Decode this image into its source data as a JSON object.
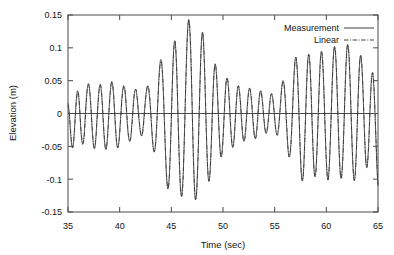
{
  "chart_data": {
    "type": "line",
    "title": "",
    "xlabel": "Time (sec)",
    "ylabel": "Elevation (m)",
    "xlim": [
      35,
      65
    ],
    "ylim": [
      -0.15,
      0.15
    ],
    "xticks": [
      35,
      40,
      45,
      50,
      55,
      60,
      65
    ],
    "xtick_labels": [
      "35",
      "40",
      "45",
      "50",
      "55",
      "60",
      "65"
    ],
    "yticks": [
      -0.15,
      -0.1,
      -0.05,
      0,
      0.05,
      0.1,
      0.15
    ],
    "ytick_labels": [
      "-0.15",
      "-0.1",
      "-0.05",
      "0",
      "0.05",
      "0.1",
      "0.15"
    ],
    "grid": false,
    "zero_line": 0,
    "legend_position": "top-right",
    "legend": [
      {
        "name": "Measurement",
        "style": "solid"
      },
      {
        "name": "Linear",
        "style": "dash-dot"
      }
    ],
    "x": [
      35.0,
      35.1,
      35.2,
      35.3,
      35.4,
      35.5,
      35.6,
      35.7,
      35.8,
      35.9,
      36.0,
      36.1,
      36.2,
      36.3,
      36.4,
      36.5,
      36.6,
      36.7,
      36.8,
      36.9,
      37.0,
      37.1,
      37.2,
      37.3,
      37.4,
      37.5,
      37.6,
      37.7,
      37.8,
      37.9,
      38.0,
      38.1,
      38.2,
      38.3,
      38.4,
      38.5,
      38.6,
      38.7,
      38.8,
      38.9,
      39.0,
      39.1,
      39.2,
      39.3,
      39.4,
      39.5,
      39.6,
      39.7,
      39.8,
      39.9,
      40.0,
      40.1,
      40.2,
      40.3,
      40.4,
      40.5,
      40.6,
      40.7,
      40.8,
      40.9,
      41.0,
      41.1,
      41.2,
      41.3,
      41.4,
      41.5,
      41.6,
      41.7,
      41.8,
      41.9,
      42.0,
      42.1,
      42.2,
      42.3,
      42.4,
      42.5,
      42.6,
      42.7,
      42.8,
      42.9,
      43.0,
      43.1,
      43.2,
      43.3,
      43.4,
      43.5,
      43.6,
      43.7,
      43.8,
      43.9,
      44.0,
      44.1,
      44.2,
      44.3,
      44.4,
      44.5,
      44.6,
      44.7,
      44.8,
      44.9,
      45.0,
      45.1,
      45.2,
      45.3,
      45.4,
      45.5,
      45.6,
      45.7,
      45.8,
      45.9,
      46.0,
      46.1,
      46.2,
      46.3,
      46.4,
      46.5,
      46.6,
      46.7,
      46.8,
      46.9,
      47.0,
      47.1,
      47.2,
      47.3,
      47.4,
      47.5,
      47.6,
      47.7,
      47.8,
      47.9,
      48.0,
      48.1,
      48.2,
      48.3,
      48.4,
      48.5,
      48.6,
      48.7,
      48.8,
      48.9,
      49.0,
      49.1,
      49.2,
      49.3,
      49.4,
      49.5,
      49.6,
      49.7,
      49.8,
      49.9,
      50.0,
      50.1,
      50.2,
      50.3,
      50.4,
      50.5,
      50.6,
      50.7,
      50.8,
      50.9,
      51.0,
      51.1,
      51.2,
      51.3,
      51.4,
      51.5,
      51.6,
      51.7,
      51.8,
      51.9,
      52.0,
      52.1,
      52.2,
      52.3,
      52.4,
      52.5,
      52.6,
      52.7,
      52.8,
      52.9,
      53.0,
      53.1,
      53.2,
      53.3,
      53.4,
      53.5,
      53.6,
      53.7,
      53.8,
      53.9,
      54.0,
      54.1,
      54.2,
      54.3,
      54.4,
      54.5,
      54.6,
      54.7,
      54.8,
      54.9,
      55.0,
      55.1,
      55.2,
      55.3,
      55.4,
      55.5,
      55.6,
      55.7,
      55.8,
      55.9,
      56.0,
      56.1,
      56.2,
      56.3,
      56.4,
      56.5,
      56.6,
      56.7,
      56.8,
      56.9,
      57.0,
      57.1,
      57.2,
      57.3,
      57.4,
      57.5,
      57.6,
      57.7,
      57.8,
      57.9,
      58.0,
      58.1,
      58.2,
      58.3,
      58.4,
      58.5,
      58.6,
      58.7,
      58.8,
      58.9,
      59.0,
      59.1,
      59.2,
      59.3,
      59.4,
      59.5,
      59.6,
      59.7,
      59.8,
      59.9,
      60.0,
      60.1,
      60.2,
      60.3,
      60.4,
      60.5,
      60.6,
      60.7,
      60.8,
      60.9,
      61.0,
      61.1,
      61.2,
      61.3,
      61.4,
      61.5,
      61.6,
      61.7,
      61.8,
      61.9,
      62.0,
      62.1,
      62.2,
      62.3,
      62.4,
      62.5,
      62.6,
      62.7,
      62.8,
      62.9,
      63.0,
      63.1,
      63.2,
      63.3,
      63.4,
      63.5,
      63.6,
      63.7,
      63.8,
      63.9,
      64.0,
      64.1,
      64.2,
      64.3,
      64.4,
      64.5,
      64.6,
      64.7,
      64.8,
      64.9,
      65.0
    ],
    "series": [
      {
        "name": "Measurement",
        "style": "solid",
        "values": [
          0.012,
          0.004,
          -0.018,
          -0.04,
          -0.052,
          -0.048,
          -0.03,
          -0.004,
          0.02,
          0.034,
          0.03,
          0.012,
          -0.014,
          -0.036,
          -0.046,
          -0.042,
          -0.024,
          0.004,
          0.028,
          0.042,
          0.045,
          0.034,
          0.012,
          -0.014,
          -0.038,
          -0.052,
          -0.052,
          -0.036,
          -0.01,
          0.016,
          0.036,
          0.044,
          0.038,
          0.018,
          -0.01,
          -0.036,
          -0.052,
          -0.054,
          -0.04,
          -0.014,
          0.014,
          0.036,
          0.048,
          0.046,
          0.03,
          0.004,
          -0.024,
          -0.044,
          -0.052,
          -0.046,
          -0.028,
          -0.004,
          0.02,
          0.036,
          0.042,
          0.036,
          0.018,
          -0.006,
          -0.028,
          -0.04,
          -0.042,
          -0.032,
          -0.012,
          0.01,
          0.028,
          0.036,
          0.034,
          0.022,
          0.004,
          -0.014,
          -0.028,
          -0.034,
          -0.03,
          -0.016,
          0.004,
          0.022,
          0.036,
          0.042,
          0.038,
          0.024,
          0.002,
          -0.024,
          -0.046,
          -0.058,
          -0.056,
          -0.04,
          -0.012,
          0.022,
          0.054,
          0.076,
          0.082,
          0.07,
          0.042,
          0.0,
          -0.046,
          -0.086,
          -0.11,
          -0.114,
          -0.096,
          -0.058,
          -0.006,
          0.048,
          0.09,
          0.11,
          0.104,
          0.072,
          0.022,
          -0.036,
          -0.086,
          -0.118,
          -0.126,
          -0.108,
          -0.068,
          -0.012,
          0.048,
          0.1,
          0.134,
          0.143,
          0.124,
          0.08,
          0.018,
          -0.048,
          -0.1,
          -0.128,
          -0.128,
          -0.102,
          -0.056,
          0.004,
          0.062,
          0.106,
          0.124,
          0.112,
          0.074,
          0.02,
          -0.036,
          -0.08,
          -0.102,
          -0.098,
          -0.072,
          -0.03,
          0.016,
          0.054,
          0.074,
          0.072,
          0.05,
          0.016,
          -0.022,
          -0.052,
          -0.066,
          -0.06,
          -0.038,
          -0.006,
          0.026,
          0.048,
          0.054,
          0.044,
          0.02,
          -0.01,
          -0.036,
          -0.05,
          -0.048,
          -0.032,
          -0.006,
          0.02,
          0.038,
          0.042,
          0.032,
          0.012,
          -0.012,
          -0.032,
          -0.042,
          -0.038,
          -0.022,
          0.0,
          0.022,
          0.036,
          0.038,
          0.028,
          0.01,
          -0.012,
          -0.03,
          -0.038,
          -0.034,
          -0.018,
          0.004,
          0.024,
          0.034,
          0.032,
          0.02,
          0.002,
          -0.016,
          -0.028,
          -0.03,
          -0.022,
          -0.006,
          0.012,
          0.026,
          0.03,
          0.024,
          0.01,
          -0.008,
          -0.024,
          -0.032,
          -0.03,
          -0.018,
          0.002,
          0.024,
          0.042,
          0.05,
          0.044,
          0.026,
          -0.002,
          -0.032,
          -0.056,
          -0.066,
          -0.06,
          -0.038,
          -0.004,
          0.034,
          0.066,
          0.084,
          0.082,
          0.06,
          0.022,
          -0.024,
          -0.068,
          -0.096,
          -0.102,
          -0.084,
          -0.046,
          0.002,
          0.048,
          0.08,
          0.09,
          0.076,
          0.042,
          -0.004,
          -0.05,
          -0.084,
          -0.096,
          -0.084,
          -0.052,
          -0.008,
          0.038,
          0.076,
          0.094,
          0.088,
          0.06,
          0.016,
          -0.032,
          -0.074,
          -0.098,
          -0.098,
          -0.074,
          -0.034,
          0.014,
          0.06,
          0.092,
          0.102,
          0.088,
          0.054,
          0.006,
          -0.042,
          -0.08,
          -0.098,
          -0.092,
          -0.064,
          -0.02,
          0.03,
          0.074,
          0.1,
          0.104,
          0.084,
          0.046,
          -0.004,
          -0.052,
          -0.088,
          -0.102,
          -0.09,
          -0.058,
          -0.012,
          0.036,
          0.072,
          0.088,
          0.08,
          0.052,
          0.01,
          -0.034,
          -0.068,
          -0.082,
          -0.072,
          -0.044,
          -0.004,
          0.034,
          0.058,
          0.06,
          0.04,
          0.004,
          -0.04,
          -0.082,
          -0.11
        ]
      },
      {
        "name": "Linear",
        "style": "dash-dot",
        "values": [
          0.016,
          0.006,
          -0.014,
          -0.036,
          -0.05,
          -0.05,
          -0.034,
          -0.008,
          0.016,
          0.032,
          0.032,
          0.016,
          -0.01,
          -0.032,
          -0.046,
          -0.044,
          -0.028,
          0.0,
          0.024,
          0.04,
          0.044,
          0.036,
          0.016,
          -0.01,
          -0.034,
          -0.05,
          -0.052,
          -0.038,
          -0.012,
          0.012,
          0.034,
          0.044,
          0.04,
          0.022,
          -0.006,
          -0.032,
          -0.05,
          -0.054,
          -0.042,
          -0.018,
          0.01,
          0.032,
          0.046,
          0.046,
          0.032,
          0.008,
          -0.02,
          -0.042,
          -0.052,
          -0.048,
          -0.032,
          -0.008,
          0.016,
          0.034,
          0.042,
          0.038,
          0.022,
          -0.002,
          -0.024,
          -0.038,
          -0.042,
          -0.034,
          -0.016,
          0.006,
          0.026,
          0.036,
          0.036,
          0.024,
          0.006,
          -0.012,
          -0.026,
          -0.034,
          -0.032,
          -0.018,
          0.0,
          0.02,
          0.034,
          0.042,
          0.04,
          0.026,
          0.006,
          -0.02,
          -0.042,
          -0.056,
          -0.056,
          -0.042,
          -0.014,
          0.018,
          0.05,
          0.072,
          0.08,
          0.072,
          0.046,
          0.004,
          -0.042,
          -0.082,
          -0.106,
          -0.114,
          -0.098,
          -0.062,
          -0.01,
          0.044,
          0.086,
          0.108,
          0.106,
          0.076,
          0.026,
          -0.032,
          -0.082,
          -0.114,
          -0.126,
          -0.112,
          -0.072,
          -0.016,
          0.044,
          0.096,
          0.13,
          0.142,
          0.128,
          0.086,
          0.024,
          -0.044,
          -0.096,
          -0.126,
          -0.13,
          -0.106,
          -0.06,
          0.0,
          0.058,
          0.102,
          0.122,
          0.114,
          0.078,
          0.024,
          -0.032,
          -0.076,
          -0.1,
          -0.1,
          -0.076,
          -0.034,
          0.012,
          0.05,
          0.072,
          0.072,
          0.054,
          0.02,
          -0.018,
          -0.05,
          -0.066,
          -0.062,
          -0.042,
          -0.01,
          0.022,
          0.046,
          0.054,
          0.046,
          0.024,
          -0.006,
          -0.032,
          -0.05,
          -0.05,
          -0.036,
          -0.01,
          0.016,
          0.036,
          0.042,
          0.034,
          0.016,
          -0.008,
          -0.03,
          -0.042,
          -0.04,
          -0.026,
          -0.004,
          0.018,
          0.034,
          0.038,
          0.03,
          0.014,
          -0.008,
          -0.028,
          -0.038,
          -0.036,
          -0.022,
          0.0,
          0.02,
          0.032,
          0.034,
          0.022,
          0.004,
          -0.014,
          -0.026,
          -0.03,
          -0.024,
          -0.01,
          0.008,
          0.024,
          0.03,
          0.026,
          0.012,
          -0.006,
          -0.022,
          -0.032,
          -0.032,
          -0.02,
          0.0,
          0.02,
          0.04,
          0.048,
          0.046,
          0.03,
          0.002,
          -0.028,
          -0.054,
          -0.066,
          -0.062,
          -0.042,
          -0.008,
          0.03,
          0.062,
          0.082,
          0.084,
          0.064,
          0.026,
          -0.02,
          -0.064,
          -0.094,
          -0.102,
          -0.088,
          -0.05,
          -0.002,
          0.044,
          0.078,
          0.09,
          0.08,
          0.046,
          0.0,
          -0.046,
          -0.082,
          -0.096,
          -0.088,
          -0.056,
          -0.012,
          0.034,
          0.072,
          0.092,
          0.09,
          0.064,
          0.02,
          -0.028,
          -0.07,
          -0.096,
          -0.1,
          -0.078,
          -0.038,
          0.01,
          0.056,
          0.09,
          0.102,
          0.092,
          0.058,
          0.01,
          -0.038,
          -0.078,
          -0.098,
          -0.094,
          -0.068,
          -0.024,
          0.026,
          0.07,
          0.098,
          0.104,
          0.088,
          0.05,
          0.0,
          -0.048,
          -0.086,
          -0.102,
          -0.094,
          -0.062,
          -0.016,
          0.032,
          0.07,
          0.088,
          0.082,
          0.056,
          0.014,
          -0.03,
          -0.066,
          -0.082,
          -0.076,
          -0.048,
          -0.008,
          0.03,
          0.056,
          0.062,
          0.044,
          0.008,
          -0.036,
          -0.078,
          -0.108
        ]
      }
    ]
  },
  "legend": {
    "measurement_label": "Measurement",
    "linear_label": "Linear"
  },
  "axes": {
    "xlabel": "Time (sec)",
    "ylabel": "Elevation (m)"
  }
}
